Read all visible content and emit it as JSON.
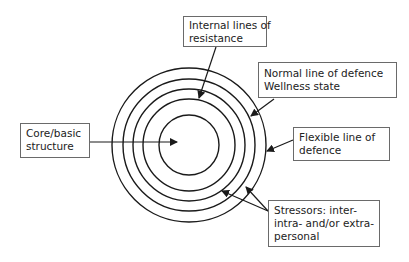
{
  "diagram": {
    "type": "concentric-circles",
    "title": "",
    "center": {
      "x": 189,
      "y": 145
    },
    "circles": [
      {
        "name": "flexible-line-of-defence",
        "r": 77
      },
      {
        "name": "normal-line-of-defence",
        "r": 66
      },
      {
        "name": "internal-line-of-resistance-outer",
        "r": 56
      },
      {
        "name": "internal-line-of-resistance-inner",
        "r": 46
      },
      {
        "name": "core-basic-structure",
        "r": 30
      }
    ],
    "colors": {
      "stroke": "#1a1a1a",
      "box_border": "#6a6a6a",
      "text": "#222222",
      "background": "#ffffff"
    }
  },
  "labels": {
    "internal_lines": {
      "line1": "Internal lines of",
      "line2": "resistance"
    },
    "normal_line": {
      "line1": "Normal line of defence",
      "line2": "Wellness state"
    },
    "flexible_line": {
      "line1": "Flexible line of",
      "line2": "defence"
    },
    "core": {
      "line1": "Core/basic",
      "line2": "structure"
    },
    "stressors": {
      "line1": "Stressors: inter-",
      "line2": "intra- and/or extra-",
      "line3": "personal"
    }
  }
}
